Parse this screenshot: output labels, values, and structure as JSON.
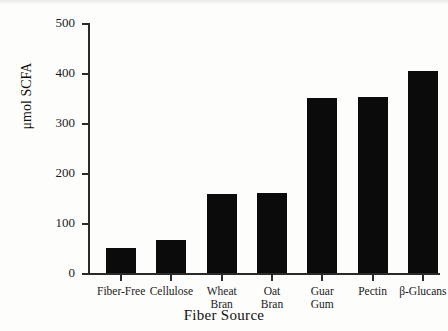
{
  "chart_data": {
    "type": "bar",
    "title": "",
    "xlabel": "Fiber Source",
    "ylabel": "μmol SCFA",
    "categories": [
      "Fiber-Free",
      "Cellulose",
      "Wheat Bran",
      "Oat Bran",
      "Guar Gum",
      "Pectin",
      "β-Glucans"
    ],
    "category_lines": [
      [
        "Fiber-Free"
      ],
      [
        "Cellulose"
      ],
      [
        "Wheat",
        "Bran"
      ],
      [
        "Oat",
        "Bran"
      ],
      [
        "Guar",
        "Gum"
      ],
      [
        "Pectin"
      ],
      [
        "β-Glucans"
      ]
    ],
    "values": [
      50,
      67,
      158,
      160,
      350,
      352,
      404
    ],
    "ylim": [
      0,
      500
    ],
    "yticks": [
      0,
      100,
      200,
      300,
      400,
      500
    ],
    "ytick_labels": [
      "0",
      "100",
      "200",
      "300",
      "400",
      "500"
    ],
    "grid": false,
    "legend": false,
    "bar_color": "#0b0b0b",
    "axis_color": "#2a2a2a",
    "background": "#fdfdfb"
  }
}
